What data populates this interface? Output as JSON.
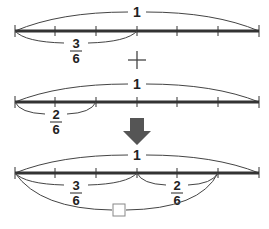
{
  "colors": {
    "line": "#333333",
    "arc": "#444444",
    "arrow": "#555555",
    "box_stroke": "#888888"
  },
  "rows": [
    {
      "whole_label": "1",
      "divisions": 6,
      "bracket": {
        "from": 0,
        "to": 3,
        "numerator": "3",
        "denominator": "6"
      }
    },
    {
      "whole_label": "1",
      "divisions": 6,
      "bracket": {
        "from": 0,
        "to": 2,
        "numerator": "2",
        "denominator": "6"
      }
    },
    {
      "whole_label": "1",
      "divisions": 6,
      "brackets": [
        {
          "from": 0,
          "to": 3,
          "numerator": "3",
          "denominator": "6"
        },
        {
          "from": 3,
          "to": 5,
          "numerator": "2",
          "denominator": "6"
        }
      ],
      "sum_bracket": {
        "from": 0,
        "to": 5,
        "label": "□"
      }
    }
  ],
  "operator": "+",
  "arrow_icon": "down-arrow"
}
